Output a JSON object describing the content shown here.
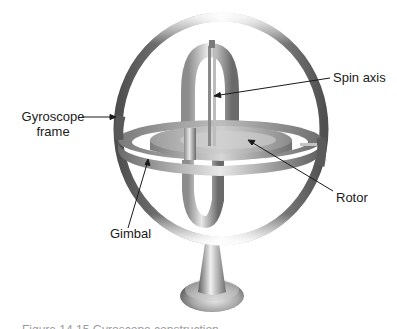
{
  "diagram": {
    "subject": "Gyroscope",
    "labels": {
      "gyroscope_frame_line1": "Gyroscope",
      "gyroscope_frame_line2": "frame",
      "spin_axis": "Spin axis",
      "rotor": "Rotor",
      "gimbal": "Gimbal"
    },
    "caption": "Figure 14.15  Gyroscope construction"
  },
  "colors": {
    "background": "#ffffff",
    "metal_dark": "#5a5a5a",
    "metal_mid": "#9a9a9a",
    "metal_light": "#e6e6e6",
    "leader_line": "#1a1a1a",
    "text": "#1a1a1a"
  }
}
